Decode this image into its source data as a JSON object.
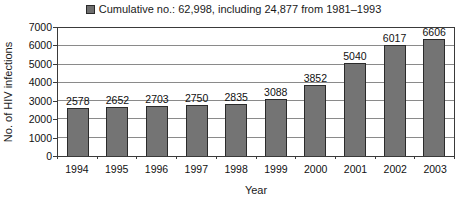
{
  "legend": {
    "label": "Cumulative no.: 62,998, including 24,877 from 1981–1993",
    "marker_color": "#6e6e6e"
  },
  "chart_data": {
    "type": "bar",
    "title": "Cumulative no.: 62,998, including 24,877 from 1981–1993",
    "categories": [
      "1994",
      "1995",
      "1996",
      "1997",
      "1998",
      "1999",
      "2000",
      "2001",
      "2002",
      "2003"
    ],
    "values": [
      2578,
      2652,
      2703,
      2750,
      2835,
      3088,
      3852,
      5040,
      6017,
      6606
    ],
    "xlabel": "Year",
    "ylabel": "No. of HIV infections",
    "ylim": [
      0,
      7000
    ],
    "yticks": [
      0,
      1000,
      2000,
      3000,
      4000,
      5000,
      6000,
      7000
    ],
    "grid": true,
    "legend_position": "top",
    "bar_color": "#747474",
    "bar_border_color": "#2b2b2b",
    "gridline_color": "#8a8a8a"
  }
}
